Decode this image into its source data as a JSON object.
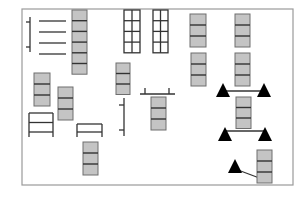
{
  "diagram": {
    "title": "",
    "colors": {
      "frame": "#9a9a9a",
      "block_fill": "#c4c4c4",
      "block_stroke": "#6e6e6e",
      "line": "#333333",
      "triangle": "#000000"
    },
    "frame": {
      "x": 22,
      "y": 9,
      "w": 271,
      "h": 176
    },
    "stacks": [
      {
        "id": "stack-top-left",
        "x": 72,
        "y": 10,
        "w": 15,
        "cells": 6,
        "cell_h": 10.7
      },
      {
        "id": "stack-left-a",
        "x": 34,
        "y": 73,
        "w": 16,
        "cells": 3,
        "cell_h": 11
      },
      {
        "id": "stack-left-b",
        "x": 58,
        "y": 87,
        "w": 15,
        "cells": 3,
        "cell_h": 11
      },
      {
        "id": "stack-mid",
        "x": 116,
        "y": 63,
        "w": 14,
        "cells": 3,
        "cell_h": 10.5
      },
      {
        "id": "stack-bottom-left",
        "x": 83,
        "y": 142,
        "w": 15,
        "cells": 3,
        "cell_h": 11
      },
      {
        "id": "stack-center-low",
        "x": 151,
        "y": 97,
        "w": 15,
        "cells": 3,
        "cell_h": 11
      },
      {
        "id": "stack-right-top-a",
        "x": 190,
        "y": 14,
        "w": 16,
        "cells": 3,
        "cell_h": 11
      },
      {
        "id": "stack-right-top-b",
        "x": 235,
        "y": 14,
        "w": 15,
        "cells": 3,
        "cell_h": 11
      },
      {
        "id": "stack-right-mid-a",
        "x": 191,
        "y": 53,
        "w": 15,
        "cells": 3,
        "cell_h": 11
      },
      {
        "id": "stack-right-mid-b",
        "x": 235,
        "y": 53,
        "w": 15,
        "cells": 3,
        "cell_h": 11
      },
      {
        "id": "stack-right-center",
        "x": 236,
        "y": 97,
        "w": 15,
        "cells": 3,
        "cell_h": 10.5
      },
      {
        "id": "stack-right-bottom",
        "x": 257,
        "y": 150,
        "w": 15,
        "cells": 3,
        "cell_h": 11
      }
    ],
    "ladders": [
      {
        "id": "grid-ladder-a",
        "x": 124,
        "y": 10,
        "w": 16,
        "rows": 4,
        "row_h": 10.7,
        "split": true
      },
      {
        "id": "grid-ladder-b",
        "x": 153,
        "y": 10,
        "w": 15,
        "rows": 4,
        "row_h": 10.7,
        "split": true
      },
      {
        "id": "ladder-left-bottom",
        "x": 29,
        "y": 113,
        "w": 24,
        "rows": 2,
        "row_h": 9.5,
        "open_bottom": true
      },
      {
        "id": "ladder-mid-bottom",
        "x": 77,
        "y": 124,
        "w": 25,
        "rows": 1,
        "row_h": 8,
        "open_bottom": true
      }
    ],
    "comb": {
      "id": "comb-top-left",
      "spine_x": 30,
      "spine_y1": 17,
      "spine_y2": 52,
      "ticks_y": [
        22,
        47
      ],
      "tines_y": [
        21,
        32,
        43,
        54
      ],
      "tine_x1": 39,
      "tine_x2": 66
    },
    "brackets": [
      {
        "id": "bracket-vertical-mid",
        "x": 124,
        "y1": 98,
        "y2": 136,
        "ticks_y": [
          105,
          130
        ],
        "tick_len": 5,
        "side": "left"
      },
      {
        "id": "bracket-horizontal-mid",
        "y": 94,
        "x1": 140,
        "x2": 175,
        "ticks_x": [
          145,
          169
        ],
        "tick_len": 6
      }
    ],
    "triangles": [
      {
        "id": "tri-a",
        "x": 223,
        "y": 95,
        "size": 12
      },
      {
        "id": "tri-b",
        "x": 264,
        "y": 95,
        "size": 12
      },
      {
        "id": "tri-c",
        "x": 225,
        "y": 139,
        "size": 12
      },
      {
        "id": "tri-d",
        "x": 265,
        "y": 139,
        "size": 12
      },
      {
        "id": "tri-e",
        "x": 235,
        "y": 171,
        "size": 12
      }
    ],
    "connectors": [
      {
        "id": "link-ab",
        "x1": 223,
        "y1": 91,
        "x2": 264,
        "y2": 91
      },
      {
        "id": "link-cd",
        "x1": 225,
        "y1": 131,
        "x2": 265,
        "y2": 131
      },
      {
        "id": "link-e-stack",
        "x1": 238,
        "y1": 170,
        "x2": 262,
        "y2": 179
      }
    ]
  }
}
